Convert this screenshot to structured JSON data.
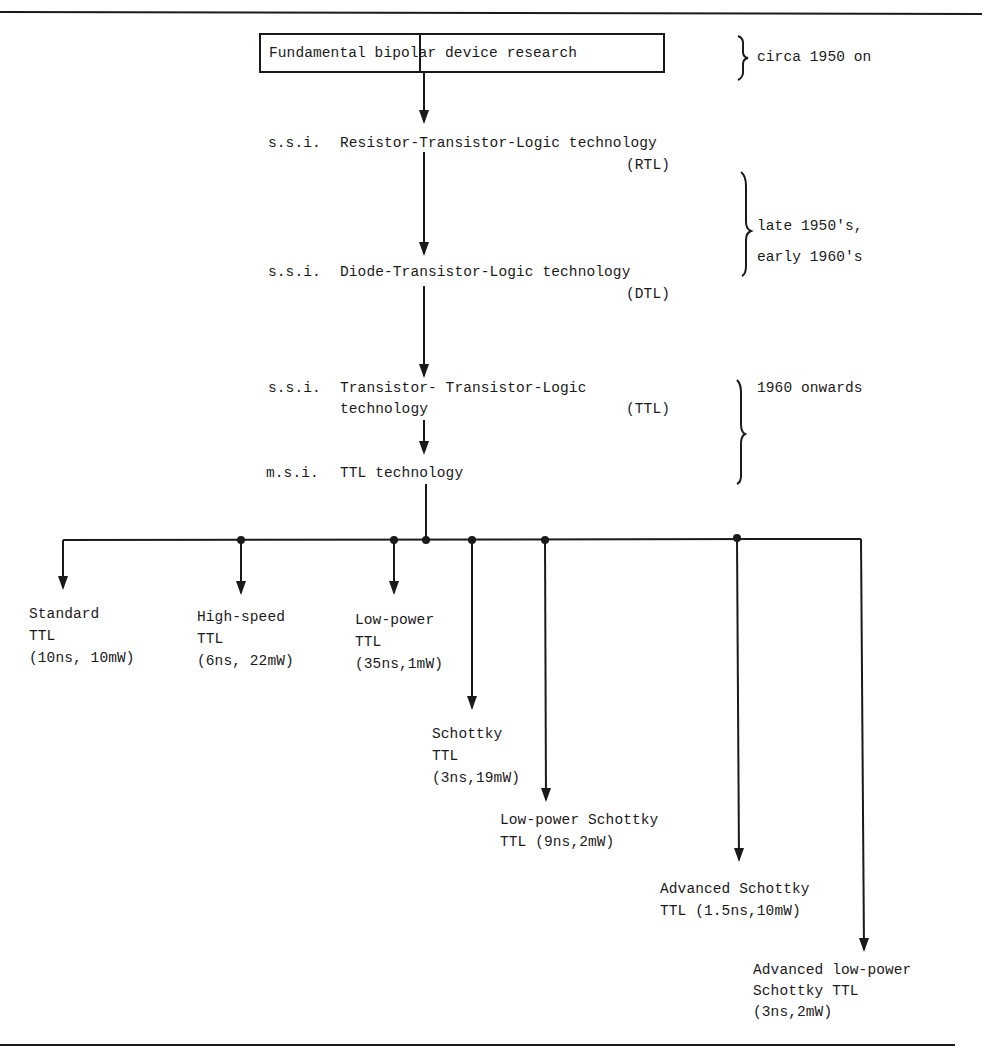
{
  "title_box": {
    "label": "Fundamental bipolar device research"
  },
  "periods": [
    {
      "label": "circa 1950 on"
    },
    {
      "line1": "late 1950's,",
      "line2": "early 1960's"
    },
    {
      "label": "1960 onwards"
    }
  ],
  "stages": [
    {
      "prefix": "s.s.i.",
      "text": "Resistor-Transistor-Logic technology",
      "abbrev": "(RTL)"
    },
    {
      "prefix": "s.s.i.",
      "text": "Diode-Transistor-Logic technology",
      "abbrev": "(DTL)"
    },
    {
      "prefix": "s.s.i.",
      "text": "Transistor- Transistor-Logic",
      "text2": "technology",
      "abbrev": "(TTL)"
    },
    {
      "prefix": "m.s.i.",
      "text": "TTL technology"
    }
  ],
  "families": [
    {
      "name": "Standard",
      "line2": "TTL",
      "specs": "(10ns, 10mW)"
    },
    {
      "name": "High-speed",
      "line2": "TTL",
      "specs": "(6ns, 22mW)"
    },
    {
      "name": "Low-power",
      "line2": "TTL",
      "specs": "(35ns,1mW)"
    },
    {
      "name": "Schottky",
      "line2": "TTL",
      "specs": "(3ns,19mW)"
    },
    {
      "name": "Low-power Schottky",
      "line2": "TTL (9ns,2mW)"
    },
    {
      "name": "Advanced Schottky",
      "line2": "TTL (1.5ns,10mW)"
    },
    {
      "name": "Advanced low-power",
      "line2": "Schottky TTL",
      "specs": "(3ns,2mW)"
    }
  ],
  "colors": {
    "ink": "#1a1a1a",
    "background": "#ffffff"
  }
}
